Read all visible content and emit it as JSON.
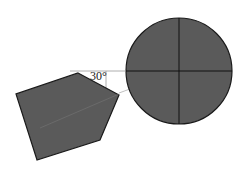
{
  "diagram": {
    "angle_label": "30°",
    "colors": {
      "fill": "#5a5a5a",
      "stroke": "#1a1a1a",
      "guide": "#9a9a9a",
      "background": "#ffffff"
    },
    "shapes": [
      {
        "type": "pentagon",
        "points": [
          [
            78,
            73
          ],
          [
            119,
            95
          ],
          [
            100,
            140
          ],
          [
            37,
            160
          ],
          [
            16,
            94
          ]
        ]
      },
      {
        "type": "circle",
        "center": [
          179,
          71
        ],
        "radius": 53,
        "crosshair": true
      }
    ]
  }
}
